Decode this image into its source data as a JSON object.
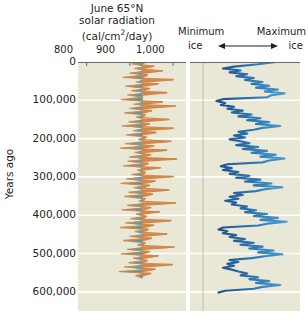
{
  "chart_data": {
    "type": "line",
    "panels": [
      {
        "name": "solar-radiation",
        "title_lines": [
          "June 65°N",
          "solar radiation",
          "(cal/cm2/day)"
        ],
        "xlabel": "",
        "xticks": [
          "800",
          "900",
          "1,000"
        ],
        "xtick_values": [
          800,
          900,
          1000
        ],
        "xlim": [
          780,
          1030
        ],
        "ylabel": "Years ago",
        "yticks": [
          "0",
          "100,000",
          "200,000",
          "300,000",
          "400,000",
          "500,000",
          "600,000"
        ],
        "ytick_values": [
          0,
          100000,
          200000,
          300000,
          400000,
          500000,
          600000
        ],
        "ylim": [
          0,
          650000
        ],
        "fill_above_color": "#d2884a",
        "fill_below_color": "#28a3d6",
        "midline_value": 930,
        "grid": true,
        "series": [
          {
            "name": "June 65N insolation",
            "units": "cal/cm2/day",
            "x": [
              935,
              905,
              955,
              912,
              975,
              900,
              940,
              885,
              1000,
              915,
              965,
              890,
              945,
              905,
              985,
              895,
              930,
              880,
              975,
              910,
              1005,
              900,
              950,
              888,
              935,
              915,
              990,
              898,
              945,
              882,
              1000,
              908,
              960,
              892,
              938,
              920,
              995,
              890,
              955,
              878,
              985,
              912,
              948,
              900,
              1008,
              896,
              942,
              885,
              970,
              918,
              935,
              905,
              1000,
              892,
              958,
              880,
              945,
              910,
              990,
              898,
              952,
              888,
              935,
              922,
              1005,
              895,
              948,
              882,
              968,
              915,
              938,
              902,
              995,
              890,
              955,
              878,
              942,
              912,
              985,
              900,
              950,
              886,
              935,
              918,
              1002,
              894,
              945,
              880,
              965,
              908,
              940,
              898,
              998,
              888,
              958,
              876,
              948,
              914,
              930
            ],
            "y": [
              0,
              5000,
              11000,
              17000,
              23000,
              29000,
              34000,
              40000,
              46000,
              52000,
              57000,
              63000,
              69000,
              75000,
              80000,
              86000,
              92000,
              98000,
              104000,
              110000,
              115000,
              121000,
              127000,
              133000,
              138000,
              144000,
              150000,
              156000,
              161000,
              167000,
              173000,
              179000,
              184000,
              190000,
              196000,
              202000,
              207000,
              213000,
              219000,
              225000,
              230000,
              236000,
              242000,
              248000,
              253000,
              259000,
              265000,
              271000,
              276000,
              282000,
              288000,
              294000,
              299000,
              305000,
              311000,
              317000,
              322000,
              328000,
              334000,
              340000,
              345000,
              351000,
              357000,
              363000,
              368000,
              374000,
              380000,
              386000,
              391000,
              397000,
              403000,
              409000,
              414000,
              420000,
              426000,
              432000,
              437000,
              443000,
              449000,
              455000,
              460000,
              466000,
              472000,
              478000,
              483000,
              489000,
              495000,
              501000,
              506000,
              512000,
              518000,
              524000,
              529000,
              535000,
              541000,
              547000,
              552000,
              558000,
              564000
            ]
          }
        ]
      },
      {
        "name": "ice-volume",
        "left_label_line1": "Minimum",
        "left_label_line2": "ice",
        "right_label_line1": "Maximum",
        "right_label_line2": "ice",
        "arrow": "double-headed",
        "xlabel": "",
        "xticks": [],
        "ylabel": "",
        "grid": true,
        "line_color_dark": "#1b4f8a",
        "line_color_light": "#4a9fd4",
        "series": [
          {
            "name": "Global ice volume (benthic d18O proxy)",
            "x_relative": [
              0.78,
              0.62,
              0.4,
              0.3,
              0.46,
              0.36,
              0.52,
              0.42,
              0.58,
              0.5,
              0.66,
              0.56,
              0.72,
              0.6,
              0.8,
              0.68,
              0.86,
              0.74,
              0.7,
              0.3,
              0.24,
              0.32,
              0.28,
              0.4,
              0.34,
              0.48,
              0.38,
              0.56,
              0.44,
              0.64,
              0.52,
              0.72,
              0.6,
              0.82,
              0.66,
              0.58,
              0.44,
              0.52,
              0.4,
              0.5,
              0.36,
              0.46,
              0.54,
              0.42,
              0.62,
              0.48,
              0.7,
              0.56,
              0.78,
              0.64,
              0.86,
              0.72,
              0.66,
              0.34,
              0.28,
              0.38,
              0.3,
              0.44,
              0.36,
              0.54,
              0.42,
              0.64,
              0.5,
              0.74,
              0.58,
              0.84,
              0.68,
              0.6,
              0.4,
              0.48,
              0.36,
              0.44,
              0.32,
              0.42,
              0.38,
              0.52,
              0.46,
              0.6,
              0.5,
              0.7,
              0.58,
              0.8,
              0.64,
              0.88,
              0.7,
              0.62,
              0.3,
              0.26,
              0.34,
              0.3,
              0.42,
              0.36,
              0.5,
              0.4,
              0.58,
              0.46,
              0.66,
              0.54,
              0.76,
              0.62,
              0.84,
              0.68,
              0.56,
              0.36,
              0.44,
              0.34,
              0.4,
              0.3,
              0.38,
              0.44,
              0.52,
              0.46,
              0.62,
              0.54,
              0.72,
              0.6,
              0.82,
              0.66,
              0.58,
              0.32,
              0.26,
              0.3
            ],
            "y": [
              0,
              6000,
              12000,
              17000,
              22000,
              27000,
              32000,
              37000,
              42000,
              47000,
              52000,
              57000,
              62000,
              67000,
              72000,
              77000,
              82000,
              87000,
              92000,
              97000,
              102000,
              107000,
              112000,
              117000,
              122000,
              127000,
              132000,
              137000,
              142000,
              147000,
              152000,
              157000,
              162000,
              167000,
              172000,
              177000,
              182000,
              187000,
              192000,
              197000,
              202000,
              207000,
              212000,
              217000,
              222000,
              227000,
              232000,
              237000,
              242000,
              247000,
              252000,
              257000,
              262000,
              267000,
              272000,
              277000,
              282000,
              287000,
              292000,
              297000,
              302000,
              307000,
              312000,
              317000,
              322000,
              327000,
              332000,
              337000,
              342000,
              347000,
              352000,
              357000,
              362000,
              367000,
              372000,
              377000,
              382000,
              387000,
              392000,
              397000,
              402000,
              407000,
              412000,
              417000,
              422000,
              427000,
              432000,
              437000,
              442000,
              447000,
              452000,
              457000,
              462000,
              467000,
              472000,
              477000,
              482000,
              487000,
              492000,
              497000,
              502000,
              507000,
              512000,
              517000,
              522000,
              527000,
              532000,
              537000,
              542000,
              547000,
              552000,
              557000,
              562000,
              567000,
              572000,
              577000,
              582000,
              587000,
              592000,
              597000,
              602000
            ]
          }
        ]
      }
    ],
    "colors": {
      "panel_background": "#e9e7d6",
      "gridline": "#ffffff",
      "orange_fill": "#d2884a",
      "cyan_fill": "#28a3d6",
      "ice_dark_blue": "#1b4f8a",
      "ice_light_blue": "#4a9fd4",
      "text": "#231f20"
    }
  },
  "header": {
    "solar": {
      "line1": "June 65°N",
      "line2": "solar radiation",
      "line3_prefix": "(cal/cm",
      "line3_sup": "2",
      "line3_suffix": "/day)"
    },
    "ice": {
      "min_line1": "Minimum",
      "min_line2": "ice",
      "max_line1": "Maximum",
      "max_line2": "ice"
    }
  },
  "axes": {
    "x_top_ticks": [
      "800",
      "900",
      "1,000"
    ],
    "y_label": "Years ago",
    "y_ticks": [
      "0",
      "100,000",
      "200,000",
      "300,000",
      "400,000",
      "500,000",
      "600,000"
    ]
  }
}
